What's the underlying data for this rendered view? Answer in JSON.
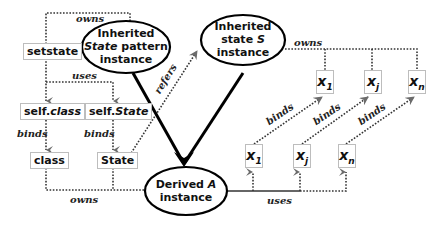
{
  "nodes": {
    "inherited_state_pattern": {
      "line1": "Inherited",
      "line2_italic": "State",
      "line2_rest": " pattern",
      "line3": "instance"
    },
    "inherited_state_s": {
      "line1": "Inherited",
      "line2": "state ",
      "line2_italic": "S",
      "line3": "instance"
    },
    "derived_a": {
      "line1": "Derived ",
      "line1_italic": "A",
      "line2": "instance"
    },
    "setstate": "setstate",
    "self_class": {
      "prefix": "self.",
      "italic": "class"
    },
    "self_state": {
      "prefix": "self.",
      "italic": "State"
    },
    "class": "class",
    "state": "State",
    "s_vars": [
      {
        "base": "x",
        "sub": "1"
      },
      {
        "base": "x",
        "sub": "j"
      },
      {
        "base": "x",
        "sub": "n"
      }
    ],
    "a_vars": [
      {
        "base": "x",
        "sub": "1"
      },
      {
        "base": "x",
        "sub": "j"
      },
      {
        "base": "x",
        "sub": "n"
      }
    ]
  },
  "edges": {
    "owns_top": "owns",
    "uses_left": "uses",
    "binds_class": "binds",
    "binds_state": "binds",
    "owns_bottom": "owns",
    "refers": "refers",
    "owns_right": "owns",
    "binds_x1": "binds",
    "binds_xj": "binds",
    "binds_xn": "binds",
    "uses_bottom": "uses"
  },
  "colors": {
    "line": "#000000",
    "dotted": "#333333",
    "arrowhead": "#666666",
    "box_border": "#bdbdbd"
  }
}
